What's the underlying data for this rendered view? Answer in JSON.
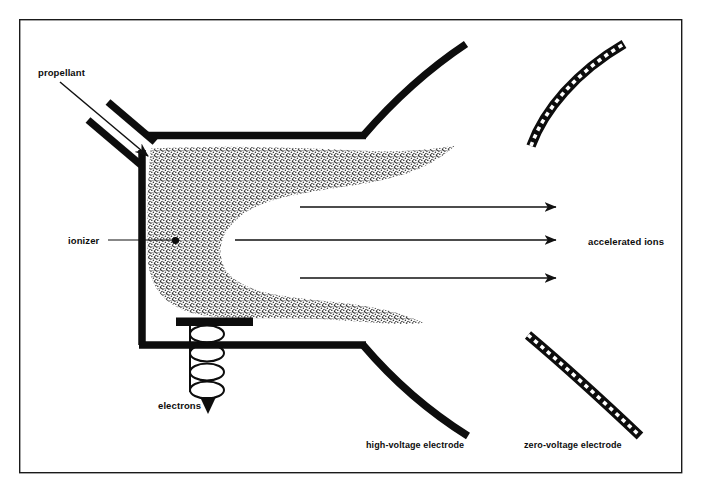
{
  "figure": {
    "type": "technical-schematic",
    "background_color": "#ffffff",
    "ink_color": "#0d0d0d",
    "plume_fill_color": "#8a8a8a",
    "frame": {
      "x": 19,
      "y": 19,
      "width": 663,
      "height": 454,
      "stroke_color": "#1a1a1a",
      "stroke_width": 1.4
    }
  },
  "labels": {
    "propellant": "propellant",
    "ionizer": "ionizer",
    "electrons": "electrons",
    "accelerated_ions": "accelerated ions",
    "high_voltage_electrode": "high-voltage electrode",
    "zero_voltage_electrode": "zero-voltage electrode"
  },
  "label_positions": {
    "propellant": {
      "x": 38,
      "y": 76
    },
    "ionizer": {
      "x": 68,
      "y": 243
    },
    "electrons": {
      "x": 160,
      "y": 407
    },
    "accelerated_ions": {
      "x": 588,
      "y": 246
    },
    "high_voltage_electrode": {
      "x": 368,
      "y": 447
    },
    "zero_voltage_electrode": {
      "x": 525,
      "y": 447
    }
  },
  "components": {
    "chamber_wall": {
      "name": "discharge-chamber-wall",
      "stroke_width": 7.5,
      "top_y": 135,
      "bottom_y": 345,
      "left_x": 142,
      "right_x": 365
    },
    "propellant_inlet": {
      "name": "propellant-inlet-duct",
      "stroke_width": 7.5,
      "upper_pipe": "M 106,101 L 152,140",
      "lower_pipe": "M 86,119 L 138,163"
    },
    "ionizer_dot": {
      "cx": 175,
      "cy": 243,
      "r": 3.4
    },
    "cathode_bar": {
      "x": 176,
      "y": 318,
      "width": 76,
      "height": 8
    },
    "electron_coil": {
      "name": "electron-emitter-coil",
      "turns": 4,
      "cx": 207,
      "top_y": 326,
      "bottom_y": 392,
      "rx": 17,
      "ry": 9
    }
  },
  "ion_beam_arrows": [
    {
      "x1": 300,
      "y1": 207,
      "x2": 562,
      "y2": 207
    },
    {
      "x1": 235,
      "y1": 240,
      "x2": 562,
      "y2": 240
    },
    {
      "x1": 300,
      "y1": 278,
      "x2": 562,
      "y2": 278
    }
  ],
  "electrodes": {
    "high_voltage": {
      "style": "solid-thick-black",
      "stroke_width": 7.5,
      "upper_curve": "M 363,135 C 385,112 420,74 466,46",
      "lower_curve": "M 363,345 C 388,372 420,405 466,434"
    },
    "zero_voltage": {
      "style": "hatched-ladder",
      "stroke_width": 9,
      "upper_curve": "M 530,145 C 545,110 575,72 622,45",
      "lower_curve": "M 528,335 C 560,360 600,398 638,434"
    }
  },
  "plume": {
    "name": "ionized-propellant-plume",
    "description": "stippled horseshoe-shaped discharge region with two tapering tails",
    "path": "M 152,150 C 210,147 300,150 360,153 C 400,155 425,153 448,150 C 420,168 390,175 352,180 C 310,186 268,190 240,212 C 218,230 212,250 222,268 C 234,290 272,296 318,300 C 360,304 392,308 415,320 C 390,322 362,318 330,316 C 280,313 225,318 192,310 C 166,303 152,285 150,258 L 150,190 Z"
  }
}
